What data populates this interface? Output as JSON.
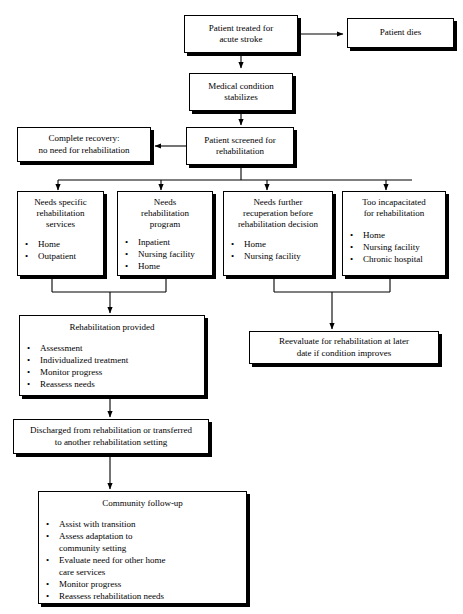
{
  "diagram": {
    "background_color": "#ffffff",
    "line_color": "#000000",
    "box_fill": "#ffffff",
    "bullet_glyph": "•"
  },
  "nodes": {
    "patient_treated": {
      "id": "patient-treated-for-acute-stroke",
      "lines": [
        "Patient treated for",
        "acute stroke"
      ]
    },
    "patient_dies": {
      "id": "patient-dies",
      "lines": [
        "Patient dies"
      ]
    },
    "medical_condition": {
      "id": "medical-condition-stabilizes",
      "lines": [
        "Medical condition",
        "stabilizes"
      ]
    },
    "patient_screened": {
      "id": "patient-screened-for-rehabilitation",
      "lines": [
        "Patient screened for",
        "rehabilitation"
      ]
    },
    "complete_recovery": {
      "id": "complete-recovery-no-need-for-rehabilitation",
      "lines": [
        "Complete recovery:",
        "no need for rehabilitation"
      ]
    },
    "needs_specific": {
      "id": "needs-specific-rehabilitation-services",
      "lines": [
        "Needs specific",
        "rehabilitation",
        "services"
      ],
      "items": [
        "Home",
        "Outpatient"
      ]
    },
    "needs_program": {
      "id": "needs-rehabilitation-program",
      "lines": [
        "Needs",
        "rehabilitation",
        "program"
      ],
      "items": [
        "Inpatient",
        "Nursing facility",
        "Home"
      ]
    },
    "needs_recuperation": {
      "id": "needs-further-recuperation",
      "lines": [
        "Needs further",
        "recuperation before",
        "rehabilitation decision"
      ],
      "items": [
        "Home",
        "Nursing facility"
      ]
    },
    "too_incapacitated": {
      "id": "too-incapacitated-for-rehabilitation",
      "lines": [
        "Too incapacitated",
        "for rehabilitation"
      ],
      "items": [
        "Home",
        "Nursing facility",
        "Chronic hospital"
      ]
    },
    "rehabilitation_provided": {
      "id": "rehabilitation-provided",
      "lines": [
        "Rehabilitation provided"
      ],
      "items": [
        "Assessment",
        "Individualized treatment",
        "Monitor progress",
        "Reassess needs"
      ]
    },
    "reevaluate": {
      "id": "reevaluate-for-rehabilitation-later",
      "lines": [
        "Reevaluate for rehabilitation at later",
        "date if condition improves"
      ]
    },
    "discharged": {
      "id": "discharged-from-rehabilitation",
      "lines": [
        "Discharged from rehabilitation or transferred",
        "to another rehabilitation setting"
      ]
    },
    "community_followup": {
      "id": "community-follow-up",
      "lines": [
        "Community follow-up"
      ],
      "items": [
        {
          "text": "Assist with transition",
          "cont": null
        },
        {
          "text": "Assess adaptation to",
          "cont": "community setting"
        },
        {
          "text": "Evaluate need for other home",
          "cont": "care services"
        },
        {
          "text": "Monitor progress",
          "cont": null
        },
        {
          "text": "Reassess rehabilitation needs",
          "cont": null
        }
      ]
    }
  }
}
